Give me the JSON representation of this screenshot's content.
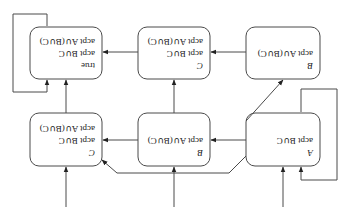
{
  "diagram": {
    "orientation": "rotated-180",
    "nodes": [
      {
        "id": "A",
        "name": "A",
        "lines": [
          "acpt B∪C"
        ],
        "row": "top",
        "col": "left"
      },
      {
        "id": "B1",
        "name": "B",
        "lines": [
          "acpt A∪(B∪C)"
        ],
        "row": "top",
        "col": "middle"
      },
      {
        "id": "C1",
        "name": "C",
        "lines": [
          "acpt B∪C",
          "acpt A∪(B∪C)"
        ],
        "row": "top",
        "col": "right"
      },
      {
        "id": "B2",
        "name": "B",
        "lines": [
          "acpt A∪(B∪C)"
        ],
        "row": "bottom",
        "col": "left"
      },
      {
        "id": "C2",
        "name": "C",
        "lines": [
          "acpt B∪C",
          "acpt A∪(B∪C)"
        ],
        "row": "bottom",
        "col": "middle"
      },
      {
        "id": "T",
        "name": "true",
        "lines": [
          "acpt B∪C",
          "acpt A∪(B∪C)"
        ],
        "row": "bottom",
        "col": "right"
      }
    ],
    "edges": [
      {
        "from": "init",
        "to": "A"
      },
      {
        "from": "init",
        "to": "B1"
      },
      {
        "from": "init",
        "to": "C1"
      },
      {
        "from": "A",
        "to": "A",
        "type": "self-loop"
      },
      {
        "from": "A",
        "to": "B1"
      },
      {
        "from": "A",
        "to": "B2"
      },
      {
        "from": "B1",
        "to": "C1"
      },
      {
        "from": "B2",
        "to": "B2",
        "type": "self-loop"
      },
      {
        "from": "B2",
        "to": "C2"
      },
      {
        "from": "B1",
        "to": "C2"
      },
      {
        "from": "C1",
        "to": "T"
      },
      {
        "from": "C2",
        "to": "T"
      },
      {
        "from": "T",
        "to": "T",
        "type": "self-loop"
      }
    ]
  },
  "labels": {
    "A_name": "A",
    "A_l1": "acpt B∪C",
    "B1_name": "B",
    "B1_l1": "acpt A∪(B∪C)",
    "C1_name": "C",
    "C1_l1": "acpt B∪C",
    "C1_l2": "acpt A∪(B∪C)",
    "B2_name": "B",
    "B2_l1": "acpt A∪(B∪C)",
    "C2_name": "C",
    "C2_l1": "acpt B∪C",
    "C2_l2": "acpt A∪(B∪C)",
    "T_name": "true",
    "T_l1": "acpt B∪C",
    "T_l2": "acpt A∪(B∪C)"
  }
}
